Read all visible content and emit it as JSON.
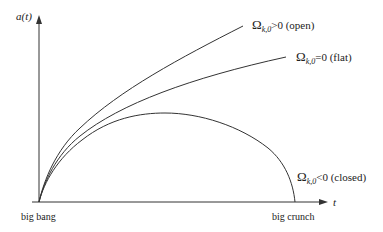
{
  "axes": {
    "y_label": "a(t)",
    "x_label": "t"
  },
  "curves": [
    {
      "id": "open",
      "symbol": "Ω",
      "subscript": "k,0",
      "relation": ">",
      "value": "0",
      "description": "(open)"
    },
    {
      "id": "flat",
      "symbol": "Ω",
      "subscript": "k,0",
      "relation": "=",
      "value": "0",
      "description": "(flat)"
    },
    {
      "id": "closed",
      "symbol": "Ω",
      "subscript": "k,0",
      "relation": "<",
      "value": "0",
      "description": "(closed)"
    }
  ],
  "events": {
    "start": "big bang",
    "end": "big crunch"
  },
  "colors": {
    "line": "#333333",
    "text": "#222222"
  }
}
